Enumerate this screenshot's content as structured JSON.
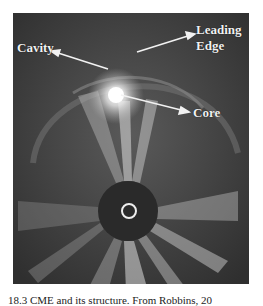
{
  "figure": {
    "labels": {
      "cavity": "Cavity",
      "leading_edge_line1": "Leading",
      "leading_edge_line2": "Edge",
      "core": "Core"
    },
    "colors": {
      "background": "#3a3a3a",
      "occulter": "#2a2a2a",
      "label": "#f2f2f2"
    }
  },
  "caption": "18.3 CME and its structure. From Robbins, 20"
}
